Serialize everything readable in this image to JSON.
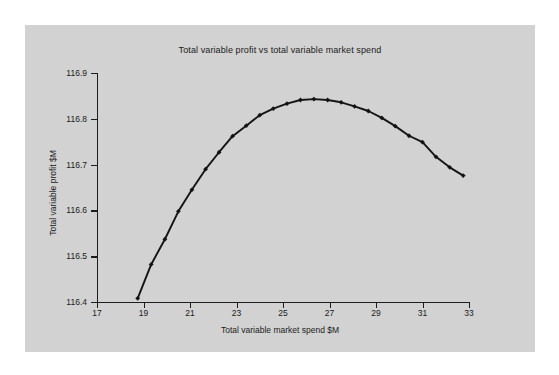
{
  "figure": {
    "background_color": "#ffffff",
    "panel_color": "#d2d2d2",
    "series_color": "#141414"
  },
  "chart_data": {
    "type": "line",
    "title": "Total variable profit vs total variable market spend",
    "xlabel": "Total variable market spend $M",
    "ylabel": "Total variable profit $M",
    "xlim": [
      17,
      33
    ],
    "ylim": [
      116.4,
      116.9
    ],
    "xticks": [
      17,
      19,
      21,
      23,
      25,
      27,
      29,
      31,
      33
    ],
    "yticks": [
      116.4,
      116.5,
      116.6,
      116.7,
      116.8,
      116.9
    ],
    "xtick_labels": [
      "17",
      "19",
      "21",
      "23",
      "25",
      "27",
      "29",
      "31",
      "33"
    ],
    "ytick_labels": [
      "116.4",
      "116.5",
      "116.6",
      "116.7",
      "116.8",
      "116.9"
    ],
    "grid": false,
    "legend": null,
    "marker": "diamond",
    "line_style": "solid",
    "series": [
      {
        "name": "Total variable profit",
        "x": [
          18.75,
          19.33,
          19.92,
          20.5,
          21.08,
          21.67,
          22.25,
          22.83,
          23.42,
          24.0,
          24.58,
          25.17,
          25.75,
          26.33,
          26.92,
          27.5,
          28.08,
          28.67,
          29.25,
          29.83,
          30.42,
          31.0,
          31.58,
          32.17,
          32.75
        ],
        "y": [
          116.408,
          116.482,
          116.537,
          116.598,
          116.645,
          116.69,
          116.727,
          116.762,
          116.785,
          116.808,
          116.822,
          116.833,
          116.841,
          116.843,
          116.841,
          116.836,
          116.827,
          116.817,
          116.802,
          116.784,
          116.763,
          116.749,
          116.717,
          116.694,
          116.676
        ]
      }
    ],
    "peak": {
      "x": 26.33,
      "y": 116.843
    }
  }
}
